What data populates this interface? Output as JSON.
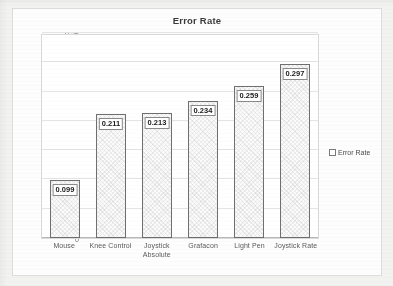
{
  "chart_data": {
    "type": "bar",
    "title": "Error Rate",
    "xlabel": "",
    "ylabel": "",
    "categories": [
      "Mouse",
      "Knee Control",
      "Joystick Absolute",
      "Grafacon",
      "Light Pen",
      "Joystick Rate"
    ],
    "values": [
      0.099,
      0.211,
      0.213,
      0.234,
      0.259,
      0.297
    ],
    "data_labels": [
      "0.099",
      "0.211",
      "0.213",
      "0.234",
      "0.259",
      "0.297"
    ],
    "ylim": [
      0,
      0.35
    ],
    "ytick_values": [
      0,
      0.05,
      0.1,
      0.15,
      0.2,
      0.25,
      0.3,
      0.35
    ],
    "ytick_labels": [
      "0",
      "0.05",
      "0.1",
      "0.15",
      "0.2",
      "0.25",
      "0.3",
      "0.35"
    ],
    "grid": true,
    "grid_axis": "y",
    "legend": {
      "position": "right",
      "entries": [
        "Error Rate"
      ]
    },
    "series": [
      {
        "name": "Error Rate",
        "values": [
          0.099,
          0.211,
          0.213,
          0.234,
          0.259,
          0.297
        ]
      }
    ],
    "category_lines": [
      [
        "Mouse"
      ],
      [
        "Knee Control"
      ],
      [
        "Joystick",
        "Absolute"
      ],
      [
        "Grafacon"
      ],
      [
        "Light Pen"
      ],
      [
        "Joystick Rate"
      ]
    ],
    "colors": {
      "bar_fill": "#fbfbfb",
      "bar_border": "#6f6f6f",
      "gridline": "#e4e4e4",
      "plot_background": "#ffffff",
      "page_background": "#f2f2f0",
      "title_text": "#3b3b3b",
      "tick_text": "#6e6e6e",
      "label_text": "#202020"
    }
  }
}
